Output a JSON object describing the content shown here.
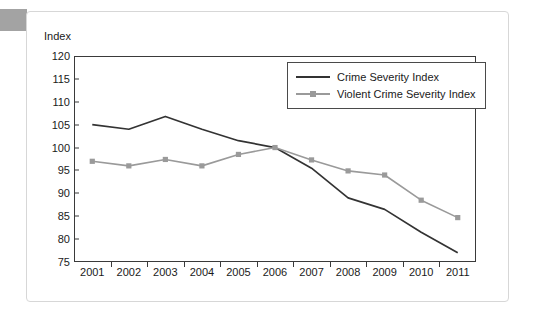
{
  "chart_data": {
    "type": "line",
    "title": "",
    "ylabel": "Index",
    "xlabel": "",
    "ylim": [
      75,
      120
    ],
    "ytick_step": 5,
    "yticks": [
      120,
      115,
      110,
      105,
      100,
      95,
      90,
      85,
      80,
      75
    ],
    "grid": false,
    "legend_position": "top-right-inside",
    "categories": [
      "2001",
      "2002",
      "2003",
      "2004",
      "2005",
      "2006",
      "2007",
      "2008",
      "2009",
      "2010",
      "2011"
    ],
    "series": [
      {
        "name": "Crime Severity Index",
        "color": "#333333",
        "marker": "none",
        "values": [
          105.0,
          104.0,
          106.8,
          104.0,
          101.5,
          100.0,
          95.5,
          89.0,
          86.5,
          81.5,
          77.0
        ]
      },
      {
        "name": "Violent Crime Severity Index",
        "color": "#9a9a9a",
        "marker": "square",
        "values": [
          97.0,
          96.0,
          97.4,
          96.0,
          98.5,
          100.0,
          97.3,
          94.9,
          94.0,
          88.5,
          84.7
        ]
      }
    ]
  },
  "axis": {
    "y_title": "Index"
  },
  "legend": {
    "entries": [
      {
        "label": "Crime Severity Index"
      },
      {
        "label": "Violent Crime Severity Index"
      }
    ]
  },
  "colors": {
    "series_dark": "#333333",
    "series_gray": "#9a9a9a",
    "axis": "#3a3a3a",
    "frame": "#d7d7d7",
    "text": "#1a1a1a"
  }
}
